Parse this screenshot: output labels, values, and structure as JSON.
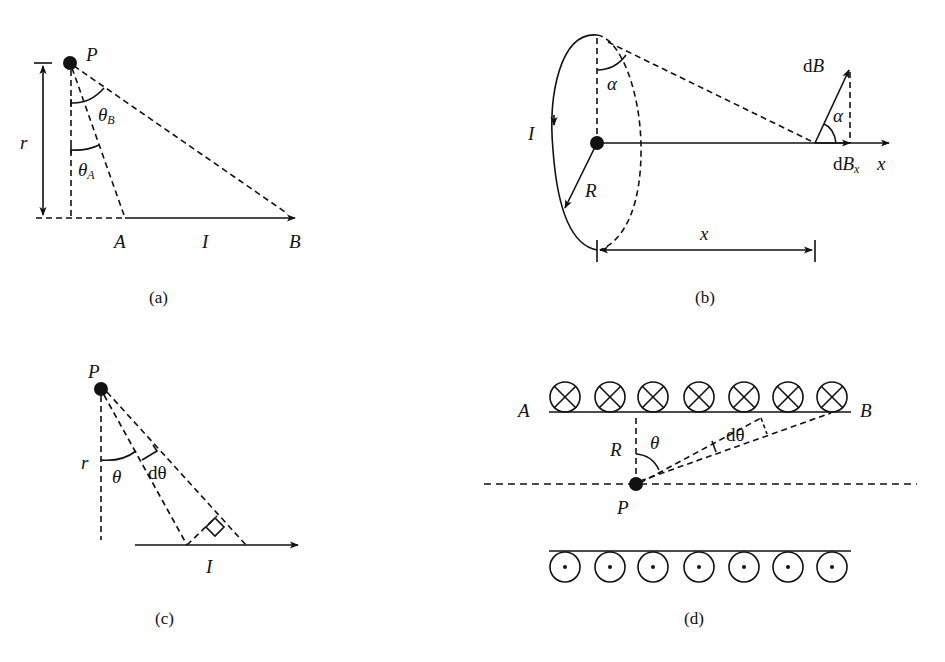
{
  "figure": {
    "panels": [
      {
        "id": "a",
        "caption": "(a)",
        "description": "Finite straight wire AB carrying current I; point P at perpendicular distance r",
        "labels": {
          "point": "P",
          "distance": "r",
          "theta_b": "θ",
          "theta_b_sub": "B",
          "theta_a": "θ",
          "theta_a_sub": "A",
          "end_a": "A",
          "current": "I",
          "end_b": "B"
        }
      },
      {
        "id": "b",
        "caption": "(b)",
        "description": "Circular current loop of radius R; field dB at distance x along axis",
        "labels": {
          "current": "I",
          "radius": "R",
          "angle_top": "α",
          "angle_vector": "α",
          "field": "dB",
          "field_d": "d",
          "field_b": "B",
          "field_x_d": "d",
          "field_x_b": "B",
          "field_x_sub": "x",
          "axis": "x",
          "distance": "x"
        }
      },
      {
        "id": "c",
        "caption": "(c)",
        "description": "Straight wire with current I; element subtending dθ at point P",
        "labels": {
          "point": "P",
          "distance": "r",
          "theta": "θ",
          "dtheta": "dθ",
          "current": "I"
        }
      },
      {
        "id": "d",
        "caption": "(d)",
        "description": "Cross-section of a solenoid: currents into page (top row) and out of page (bottom row); point P on axis",
        "labels": {
          "end_a": "A",
          "end_b": "B",
          "radius": "R",
          "theta": "θ",
          "dtheta": "dθ",
          "point": "P"
        },
        "top_row_symbol": "circle-cross-icon",
        "bottom_row_symbol": "circle-dot-icon",
        "turns_per_row": 7
      }
    ],
    "colors": {
      "ink": "#111111",
      "background": "#ffffff"
    }
  }
}
